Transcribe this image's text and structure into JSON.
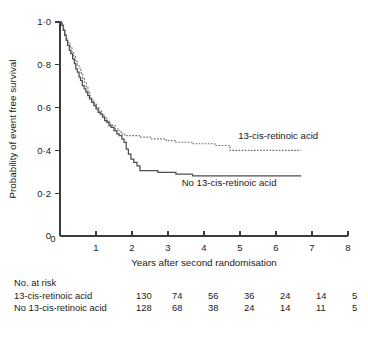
{
  "chart_data": {
    "type": "line",
    "plot_kind": "kaplan-meier-step",
    "title": "",
    "xlabel": "Years after second randomisation",
    "ylabel": "Probability of event free survival",
    "xlim": [
      0,
      8
    ],
    "ylim": [
      0,
      1
    ],
    "xticks": [
      0,
      1,
      2,
      3,
      4,
      5,
      6,
      7,
      8
    ],
    "xticklabels": [
      "0",
      "1",
      "2",
      "3",
      "4",
      "5",
      "6",
      "7",
      "8"
    ],
    "yticks": [
      0,
      0.2,
      0.4,
      0.6,
      0.8,
      1.0
    ],
    "yticklabels": [
      "0",
      "0·2",
      "0·4",
      "0·6",
      "0·8",
      "1·0"
    ],
    "grid": false,
    "legend_position": "inline-annotation",
    "series": [
      {
        "name": "13-cis-retinoic acid",
        "style": "dotted",
        "color": "#6b6b6b",
        "label_x": 4.95,
        "label_y": 0.455,
        "points": [
          [
            0.0,
            1.0
          ],
          [
            0.06,
            0.985
          ],
          [
            0.1,
            0.962
          ],
          [
            0.14,
            0.938
          ],
          [
            0.18,
            0.915
          ],
          [
            0.23,
            0.9
          ],
          [
            0.28,
            0.885
          ],
          [
            0.33,
            0.862
          ],
          [
            0.38,
            0.838
          ],
          [
            0.43,
            0.815
          ],
          [
            0.48,
            0.8
          ],
          [
            0.53,
            0.785
          ],
          [
            0.58,
            0.762
          ],
          [
            0.63,
            0.738
          ],
          [
            0.68,
            0.715
          ],
          [
            0.73,
            0.692
          ],
          [
            0.78,
            0.669
          ],
          [
            0.83,
            0.646
          ],
          [
            0.88,
            0.631
          ],
          [
            0.95,
            0.615
          ],
          [
            1.02,
            0.6
          ],
          [
            1.08,
            0.585
          ],
          [
            1.15,
            0.569
          ],
          [
            1.22,
            0.554
          ],
          [
            1.3,
            0.538
          ],
          [
            1.38,
            0.523
          ],
          [
            1.46,
            0.515
          ],
          [
            1.54,
            0.5
          ],
          [
            1.62,
            0.492
          ],
          [
            1.7,
            0.477
          ],
          [
            1.8,
            0.469
          ],
          [
            2.05,
            0.469
          ],
          [
            2.2,
            0.462
          ],
          [
            2.42,
            0.462
          ],
          [
            2.55,
            0.454
          ],
          [
            2.8,
            0.454
          ],
          [
            2.95,
            0.446
          ],
          [
            3.1,
            0.446
          ],
          [
            3.22,
            0.438
          ],
          [
            3.55,
            0.438
          ],
          [
            3.7,
            0.431
          ],
          [
            4.1,
            0.431
          ],
          [
            4.3,
            0.423
          ],
          [
            4.62,
            0.423
          ],
          [
            4.72,
            0.4
          ],
          [
            6.7,
            0.4
          ]
        ]
      },
      {
        "name": "No 13-cis-retinoic acid",
        "style": "solid",
        "color": "#4d4d4d",
        "label_x": 3.38,
        "label_y": 0.232,
        "points": [
          [
            0.0,
            1.0
          ],
          [
            0.05,
            0.984
          ],
          [
            0.09,
            0.961
          ],
          [
            0.13,
            0.938
          ],
          [
            0.17,
            0.914
          ],
          [
            0.21,
            0.891
          ],
          [
            0.26,
            0.867
          ],
          [
            0.3,
            0.852
          ],
          [
            0.35,
            0.828
          ],
          [
            0.4,
            0.805
          ],
          [
            0.44,
            0.781
          ],
          [
            0.48,
            0.766
          ],
          [
            0.53,
            0.742
          ],
          [
            0.57,
            0.727
          ],
          [
            0.62,
            0.703
          ],
          [
            0.67,
            0.688
          ],
          [
            0.72,
            0.672
          ],
          [
            0.77,
            0.656
          ],
          [
            0.82,
            0.641
          ],
          [
            0.88,
            0.625
          ],
          [
            0.94,
            0.609
          ],
          [
            1.0,
            0.594
          ],
          [
            1.06,
            0.578
          ],
          [
            1.12,
            0.57
          ],
          [
            1.18,
            0.555
          ],
          [
            1.24,
            0.539
          ],
          [
            1.3,
            0.531
          ],
          [
            1.36,
            0.516
          ],
          [
            1.42,
            0.508
          ],
          [
            1.5,
            0.492
          ],
          [
            1.58,
            0.477
          ],
          [
            1.64,
            0.469
          ],
          [
            1.72,
            0.453
          ],
          [
            1.78,
            0.438
          ],
          [
            1.84,
            0.406
          ],
          [
            1.9,
            0.383
          ],
          [
            1.97,
            0.359
          ],
          [
            2.05,
            0.344
          ],
          [
            2.14,
            0.328
          ],
          [
            2.22,
            0.305
          ],
          [
            2.58,
            0.305
          ],
          [
            2.72,
            0.297
          ],
          [
            3.1,
            0.297
          ],
          [
            3.22,
            0.289
          ],
          [
            3.58,
            0.289
          ],
          [
            3.68,
            0.281
          ],
          [
            6.7,
            0.281
          ]
        ]
      }
    ],
    "risk_table": {
      "title": "No. at risk",
      "time_points": [
        0,
        1,
        2,
        3,
        4,
        5,
        6
      ],
      "rows": [
        {
          "label": "13-cis-retinoic acid",
          "counts": [
            "130",
            "74",
            "56",
            "36",
            "24",
            "14",
            "5"
          ]
        },
        {
          "label": "No 13-cis-retinoic acid",
          "counts": [
            "128",
            "68",
            "38",
            "24",
            "14",
            "11",
            "5"
          ]
        }
      ]
    }
  }
}
